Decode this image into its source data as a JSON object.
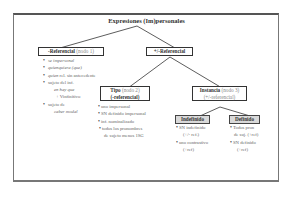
{
  "title": "Expresiones (Im)personales",
  "nodes": {
    "neg_ref": {
      "label": "-Referencial",
      "note": "(nodo 1)"
    },
    "pm_ref": {
      "label": "+/-Referencial"
    },
    "tipo": {
      "label": "Tipo",
      "note": "(nodo 2)",
      "sub": "(-referencial)"
    },
    "instancia": {
      "label": "Instancia",
      "note": "(nodo 3)",
      "sub": "(+/-referencial)"
    },
    "indefinido": {
      "label": "Indefinido"
    },
    "definido": {
      "label": "Definido"
    }
  },
  "lists": {
    "neg_ref": [
      {
        "text": "se impersonal",
        "italic": true
      },
      {
        "text": "quienquiera (que)",
        "italic": true
      },
      {
        "text_italic": "quien",
        "text": " rel. sin antecedente"
      },
      {
        "text": "sujeto del inf."
      },
      {
        "cont": "en hay que",
        "italic": true
      },
      {
        "cont": "+ Vinfinitivo"
      },
      {
        "text": "sujeto de"
      },
      {
        "cont": "caber modal"
      }
    ],
    "tipo": [
      "uno impersonal",
      "SN definido impersonal",
      "inf. nominalizado",
      "todos los pronombres",
      "de sujeto menos 1SG"
    ],
    "indefinido": [
      "SN indefinido",
      "(+/- ref.)",
      "uno contrastivo",
      "(+ref)"
    ],
    "definido": [
      "Todos pron",
      "de suj. (+ref)",
      "SN definido",
      "(+ref)"
    ]
  }
}
